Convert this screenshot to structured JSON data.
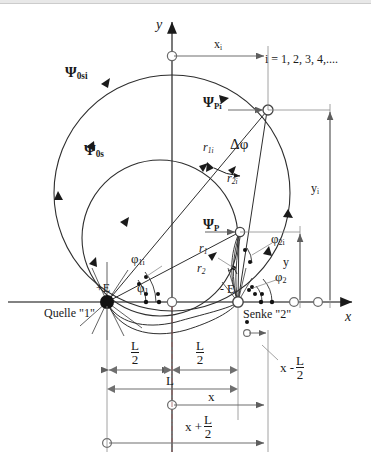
{
  "figure": {
    "type": "technical-diagram",
    "axes": {
      "x_label": "x",
      "y_label": "y"
    },
    "index_note": "i = 1, 2, 3, 4,....",
    "points": {
      "source_label": "+E",
      "source_caption": "Quelle \"1\"",
      "sink_label": "- E",
      "sink_caption": "Senke \"2\""
    },
    "streamlines": {
      "outer_label": "Ψ",
      "outer_sub": "0si",
      "inner_label": "Ψ",
      "inner_sub": "0s"
    },
    "field_points": {
      "upper_label": "Ψ",
      "upper_sub": "Pi",
      "lower_label": "Ψ",
      "lower_sub": "P"
    },
    "radii": {
      "r1i": "r",
      "r1i_sub": "1i",
      "r2i": "r",
      "r2i_sub": "2i",
      "r1": "r",
      "r1_sub": "1",
      "r2": "r",
      "r2_sub": "2"
    },
    "angles": {
      "delta_phi": "Δφ",
      "phi1i": "φ",
      "phi1i_sub": "1i",
      "phi1": "φ",
      "phi1_sub": "1",
      "phi2i": "φ",
      "phi2i_sub": "2i",
      "phi2": "φ",
      "phi2_sub": "2"
    },
    "dimensions": {
      "xi": "x",
      "xi_sub": "i",
      "yi": "y",
      "yi_sub": "i",
      "y": "y",
      "half_L_left_num": "L",
      "half_L_left_den": "2",
      "half_L_right_num": "L",
      "half_L_right_den": "2",
      "L": "L",
      "x": "x",
      "x_plus_half_L_lead": "x +",
      "x_plus_half_L_num": "L",
      "x_plus_half_L_den": "2",
      "x_minus_half_L_lead": "x -",
      "x_minus_half_L_num": "L",
      "x_minus_half_L_den": "2"
    },
    "colors": {
      "ink": "#1a1a1a",
      "dimension_line": "#6f6f6f",
      "curve": "#3a3a3a",
      "axis": "#555555"
    }
  }
}
